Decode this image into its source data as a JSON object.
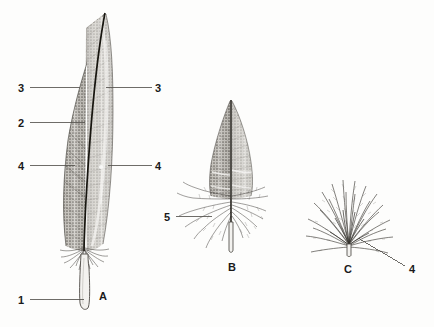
{
  "figure": {
    "background_color": "#fdfdfc",
    "ink_color": "#1a1a1a",
    "leader_color": "#4a4a4a"
  },
  "callouts": [
    {
      "id": "a-3-left",
      "text": "3",
      "x": 18,
      "y": 83,
      "side": "left"
    },
    {
      "id": "a-3-right",
      "text": "3",
      "x": 155,
      "y": 83,
      "side": "right"
    },
    {
      "id": "a-2-left",
      "text": "2",
      "x": 18,
      "y": 118,
      "side": "left"
    },
    {
      "id": "a-4-left",
      "text": "4",
      "x": 18,
      "y": 161,
      "side": "left"
    },
    {
      "id": "a-4-right",
      "text": "4",
      "x": 155,
      "y": 161,
      "side": "right"
    },
    {
      "id": "a-1-left",
      "text": "1",
      "x": 18,
      "y": 295,
      "side": "left"
    },
    {
      "id": "b-5-left",
      "text": "5",
      "x": 164,
      "y": 212,
      "side": "left"
    },
    {
      "id": "c-4-right",
      "text": "4",
      "x": 409,
      "y": 264,
      "side": "right"
    }
  ],
  "plate_labels": [
    {
      "id": "plate-a",
      "text": "A",
      "x": 99,
      "y": 291
    },
    {
      "id": "plate-b",
      "text": "B",
      "x": 228,
      "y": 262
    },
    {
      "id": "plate-c",
      "text": "C",
      "x": 344,
      "y": 264
    }
  ],
  "specimens": [
    {
      "id": "feather-a",
      "plate": "A",
      "type": "contour-flight-feather",
      "tip": {
        "x": 105,
        "y": 12
      },
      "vane_left": 62,
      "vane_right": 113,
      "vane_bottom": 250,
      "rachis_x": 86,
      "calamus_bottom": 311
    },
    {
      "id": "feather-b",
      "plate": "B",
      "type": "semiplume-contour-feather",
      "tip": {
        "x": 231,
        "y": 99
      },
      "vane_left": 209,
      "vane_right": 251,
      "vane_bottom": 192,
      "down_bottom": 238,
      "rachis_x": 231,
      "calamus_bottom": 253
    },
    {
      "id": "feather-c",
      "plate": "C",
      "type": "down-feather",
      "center": {
        "x": 349,
        "y": 246
      },
      "spread_left": 304,
      "spread_right": 396,
      "top": 177,
      "calamus_bottom": 255
    }
  ],
  "leaders": [
    {
      "id": "leader-a-3-left",
      "x1": 30,
      "y1": 87,
      "x2": 80,
      "y2": 87
    },
    {
      "id": "leader-a-3-right",
      "x1": 152,
      "y1": 87,
      "x2": 106,
      "y2": 87
    },
    {
      "id": "leader-a-2-left",
      "x1": 30,
      "y1": 122,
      "x2": 85,
      "y2": 122
    },
    {
      "id": "leader-a-4-left",
      "x1": 30,
      "y1": 165,
      "x2": 75,
      "y2": 165
    },
    {
      "id": "leader-a-4-right",
      "x1": 152,
      "y1": 165,
      "x2": 108,
      "y2": 165
    },
    {
      "id": "leader-a-1-left",
      "x1": 30,
      "y1": 299,
      "x2": 84,
      "y2": 299
    },
    {
      "id": "leader-b-5-left",
      "x1": 176,
      "y1": 216,
      "x2": 212,
      "y2": 216
    },
    {
      "id": "leader-c-4-right",
      "x1": 405,
      "y1": 266,
      "x2": 358,
      "y2": 238
    }
  ]
}
